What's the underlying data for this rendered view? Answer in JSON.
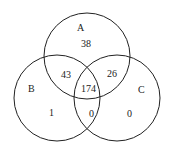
{
  "diagram": {
    "type": "venn3",
    "sets": {
      "A": "A",
      "B": "B",
      "C": "C"
    },
    "regions": {
      "A_only": "38",
      "B_only": "1",
      "C_only": "0",
      "A_B": "43",
      "A_C": "26",
      "B_C": "0",
      "A_B_C": "174"
    },
    "stroke_color": "#222222"
  }
}
